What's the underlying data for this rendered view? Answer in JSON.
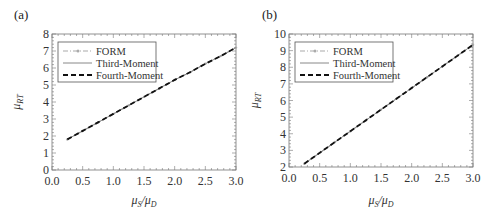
{
  "figure": {
    "panels": [
      {
        "label": "(a)"
      },
      {
        "label": "(b)"
      }
    ]
  },
  "chart_data": [
    {
      "type": "line",
      "panel": "(a)",
      "title": "",
      "xlabel": "μS/μD",
      "ylabel": "μRT",
      "xlim": [
        0.0,
        3.0
      ],
      "ylim": [
        0,
        8
      ],
      "xticks": [
        "0.0",
        "0.5",
        "1.0",
        "1.5",
        "2.0",
        "2.5",
        "3.0"
      ],
      "yticks": [
        "0",
        "1",
        "2",
        "3",
        "4",
        "5",
        "6",
        "7",
        "8"
      ],
      "grid": false,
      "legend_position": "upper left",
      "x": [
        0.25,
        0.5,
        0.75,
        1.0,
        1.25,
        1.5,
        1.75,
        2.0,
        2.25,
        2.5,
        2.75,
        3.0
      ],
      "series": [
        {
          "name": "FORM",
          "style": "dash-dot with markers",
          "color": "#aaaaaa",
          "values": [
            1.8,
            2.3,
            2.8,
            3.3,
            3.8,
            4.3,
            4.8,
            5.3,
            5.75,
            6.25,
            6.7,
            7.2
          ]
        },
        {
          "name": "Third-Moment",
          "style": "solid",
          "color": "#888888",
          "values": [
            1.8,
            2.3,
            2.8,
            3.3,
            3.8,
            4.3,
            4.8,
            5.3,
            5.75,
            6.25,
            6.7,
            7.2
          ]
        },
        {
          "name": "Fourth-Moment",
          "style": "dashed",
          "color": "#111111",
          "values": [
            1.8,
            2.3,
            2.8,
            3.3,
            3.8,
            4.3,
            4.8,
            5.3,
            5.75,
            6.25,
            6.7,
            7.2
          ]
        }
      ]
    },
    {
      "type": "line",
      "panel": "(b)",
      "title": "",
      "xlabel": "μS/μD",
      "ylabel": "μRT",
      "xlim": [
        0.0,
        3.0
      ],
      "ylim": [
        2,
        10
      ],
      "xticks": [
        "0.0",
        "0.5",
        "1.0",
        "1.5",
        "2.0",
        "2.5",
        "3.0"
      ],
      "yticks": [
        "2",
        "3",
        "4",
        "5",
        "6",
        "7",
        "8",
        "9",
        "10"
      ],
      "grid": false,
      "legend_position": "upper left",
      "x": [
        0.25,
        0.5,
        0.75,
        1.0,
        1.25,
        1.5,
        1.75,
        2.0,
        2.25,
        2.5,
        2.75,
        3.0
      ],
      "series": [
        {
          "name": "FORM",
          "style": "dash-dot with markers",
          "color": "#aaaaaa",
          "values": [
            2.2,
            2.85,
            3.5,
            4.15,
            4.8,
            5.45,
            6.1,
            6.75,
            7.4,
            8.05,
            8.7,
            9.35
          ]
        },
        {
          "name": "Third-Moment",
          "style": "solid",
          "color": "#888888",
          "values": [
            2.2,
            2.85,
            3.5,
            4.15,
            4.8,
            5.45,
            6.1,
            6.75,
            7.4,
            8.05,
            8.7,
            9.35
          ]
        },
        {
          "name": "Fourth-Moment",
          "style": "dashed",
          "color": "#111111",
          "values": [
            2.2,
            2.85,
            3.5,
            4.15,
            4.8,
            5.45,
            6.1,
            6.75,
            7.4,
            8.05,
            8.7,
            9.35
          ]
        }
      ]
    }
  ]
}
